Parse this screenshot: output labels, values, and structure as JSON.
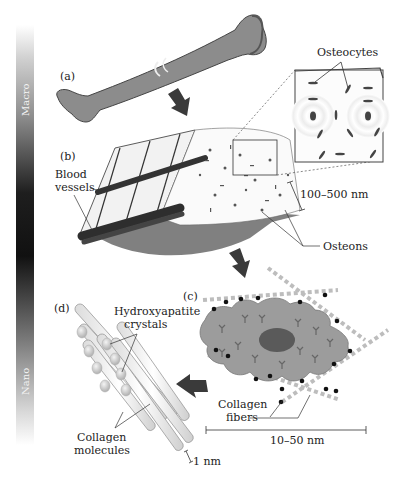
{
  "figure": {
    "scale_bar": {
      "top_label": "Macro",
      "bottom_label": "Nano"
    },
    "panels": {
      "a": {
        "tag": "(a)"
      },
      "b": {
        "tag": "(b)"
      },
      "c": {
        "tag": "(c)"
      },
      "d": {
        "tag": "(d)"
      }
    },
    "labels": {
      "osteocytes": "Osteocytes",
      "blood_vessels_1": "Blood",
      "blood_vessels_2": "vessels",
      "size_b": "100–500 nm",
      "osteons": "Osteons",
      "hydroxyapatite_1": "Hydroxyapatite",
      "hydroxyapatite_2": "crystals",
      "collagen_fibers_1": "Collagen",
      "collagen_fibers_2": "fibers",
      "size_c": "10–50 nm",
      "collagen_molecules_1": "Collagen",
      "collagen_molecules_2": "molecules",
      "size_d": "1 nm"
    },
    "colors": {
      "bone_fill": "#8a8a8a",
      "bone_edge": "#444444",
      "arrow": "#3a3a3a",
      "cell_fill": "#9a9a9a",
      "nucleus": "#555555",
      "vessel": "#333333"
    }
  }
}
